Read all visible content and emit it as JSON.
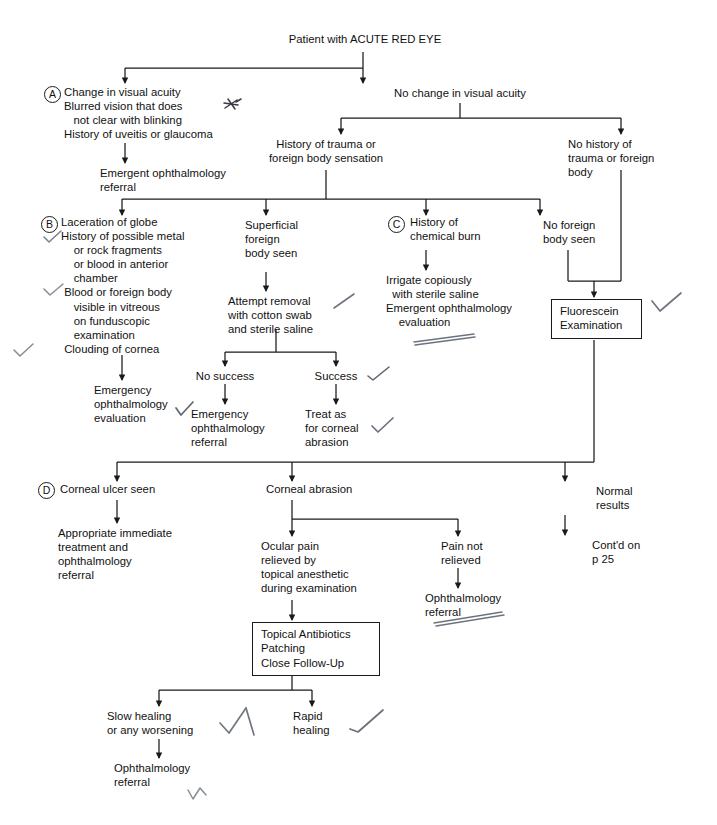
{
  "document": {
    "type": "clinical-algorithm-flowchart",
    "title": "Patient with ACUTE RED EYE",
    "ink_color": "#1a1a1a",
    "background_color": "#ffffff",
    "text_color": "#111111"
  },
  "labels": {
    "a": "A",
    "b": "B",
    "c": "C",
    "d": "D"
  },
  "nodes": {
    "root": "Patient with ACUTE RED EYE",
    "change_acuity": "Change in visual acuity\nBlurred vision that does\n   not clear with blinking\nHistory of uveitis or glaucoma",
    "emergent_referral": "Emergent ophthalmology\nreferral",
    "no_change_acuity": "No change in visual acuity",
    "history_trauma": "History of trauma or\nforeign body sensation",
    "no_history_trauma": "No history of\ntrauma or foreign\nbody",
    "laceration": "Laceration of globe\nHistory of possible metal\n    or rock fragments\n    or blood in anterior\n    chamber\n Blood or foreign body\n    visible in vitreous\n    on funduscopic\n    examination\n Clouding of cornea",
    "emergency_eval": "Emergency\nophthalmology\nevaluation",
    "superficial_fb": "Superficial\nforeign\nbody seen",
    "attempt_removal": "Attempt removal\nwith cotton swab\nand sterile saline",
    "no_success": "No success",
    "no_success_action": "Emergency\nophthalmology\nreferral",
    "success": "Success",
    "success_action": "Treat as\nfor corneal\nabrasion",
    "chemical_burn": "History of\nchemical burn",
    "irrigate": "Irrigate copiously\n  with sterile saline\nEmergent ophthalmology\n    evaluation",
    "no_fb_seen": "No foreign\nbody seen",
    "fluorescein": "Fluorescein\nExamination",
    "corneal_ulcer": "Corneal ulcer seen",
    "ulcer_action": "Appropriate immediate\ntreatment and\nophthalmology\nreferral",
    "corneal_abrasion": "Corneal abrasion",
    "ocular_pain_relieved": "Ocular pain\nrelieved by\ntopical anesthetic\nduring examination",
    "pain_not_relieved": "Pain not\nrelieved",
    "pain_not_relieved_action": "Ophthalmology\nreferral",
    "topical_box": "Topical Antibiotics\nPatching\nClose Follow-Up",
    "slow_healing": "Slow healing\nor any worsening",
    "slow_healing_action": "Ophthalmology\nreferral",
    "rapid_healing": "Rapid\nhealing",
    "normal_results": "Normal\nresults",
    "contd": "Cont'd on\np 25"
  },
  "annotations": {
    "asterisk_mark": "handwritten-asterisk-mark",
    "check_marks": "handwritten-check-marks",
    "underline_marks": "handwritten-underline-marks",
    "count_checks": 9
  }
}
